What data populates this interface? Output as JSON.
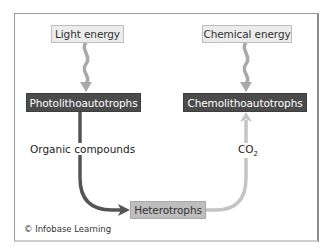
{
  "diagram": {
    "nodes": {
      "light_energy": "Light energy",
      "chemical_energy": "Chemical energy",
      "photolithoautotrophs": "Photolithoautotrophs",
      "chemolithoautotrophs": "Chemolithoautotrophs",
      "heterotrophs": "Heterotrophs"
    },
    "edge_labels": {
      "organic_compounds": "Organic compounds",
      "co2_base": "CO",
      "co2_subscript": "2"
    },
    "edges": [
      {
        "from": "Light energy",
        "to": "Photolithoautotrophs",
        "style": "wavy",
        "color": "#a9a9a9"
      },
      {
        "from": "Chemical energy",
        "to": "Chemolithoautotrophs",
        "style": "wavy",
        "color": "#a9a9a9"
      },
      {
        "from": "Photolithoautotrophs",
        "to": "Heterotrophs",
        "label": "Organic compounds",
        "color": "#555555"
      },
      {
        "from": "Heterotrophs",
        "to": "Chemolithoautotrophs",
        "label": "CO2",
        "color": "#c4c4c4"
      }
    ],
    "colors": {
      "source_fill": "#ececec",
      "organism_fill": "#4b4b4b",
      "heterotroph_fill": "#bebebe",
      "frame_border": "#9a9a9a"
    }
  },
  "credit": "© Infobase Learning"
}
